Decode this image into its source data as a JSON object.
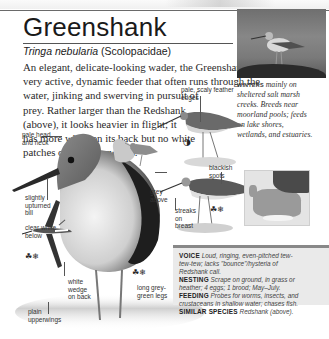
{
  "page": {
    "title": "Greenshank",
    "scientific_name": "Tringa nebularia",
    "family": "(Scolopacidae)",
    "description_lines": [
      "An elegant, delicate-looking wader, the Greenshank is a",
      "very active, dynamic feeder that often runs through the",
      "water, jinking and swerving in pursuit of",
      "prey. Rather larger than the Redshank",
      "(above), it looks heavier in flight; it",
      "has more white on its back but no white",
      "patches on its upperwings."
    ]
  },
  "photo_caption": {
    "keyword": "WINTERS",
    "lines": [
      "mainly on",
      "sheltered salt marsh",
      "creeks. Breeds near",
      "moorland pools; feeds",
      "on lake shores,",
      "wetlands, and estuaries."
    ]
  },
  "annotations": {
    "pale_head": [
      "pale head",
      "and neck"
    ],
    "upturned_bill": [
      "slightly",
      "upturned",
      "bill"
    ],
    "clear_white": [
      "clear white",
      "below"
    ],
    "white_wedge": [
      "white",
      "wedge",
      "on back"
    ],
    "plain_upperwings": [
      "plain",
      "upperwings"
    ],
    "long_legs": [
      "long grey-",
      "green legs"
    ],
    "scaly_edges": [
      "pale, scaly feather",
      "edges"
    ],
    "grey_above": [
      "grey",
      "above"
    ],
    "blackish_spots": [
      "blackish",
      "spots"
    ],
    "streaks": [
      "streaks",
      "on",
      "breast"
    ]
  },
  "season_icons": {
    "summer_winter": "☘❄",
    "moon": "◑"
  },
  "info_box": {
    "voice_label": "VOICE",
    "voice_text_1": "Loud, ringing, even-pitched tew-",
    "voice_text_2": "tew-tew; lacks \"bounce\"/hysteria of",
    "voice_text_3": "Redshank call.",
    "nesting_label": "NESTING",
    "nesting_text_1": "Scrape on ground, in grass or",
    "nesting_text_2": "heather; 4 eggs; 1 brood; May–July.",
    "feeding_label": "FEEDING",
    "feeding_text_1": "Probes for worms, insects, and",
    "feeding_text_2": "crustaceans in shallow water; chases fish.",
    "similar_label": "SIMILAR SPECIES",
    "similar_text": "Redshank (above)."
  },
  "colors": {
    "text": "#2a2a2a",
    "box_bg": "#eaeaea",
    "box_rule": "#888888"
  }
}
